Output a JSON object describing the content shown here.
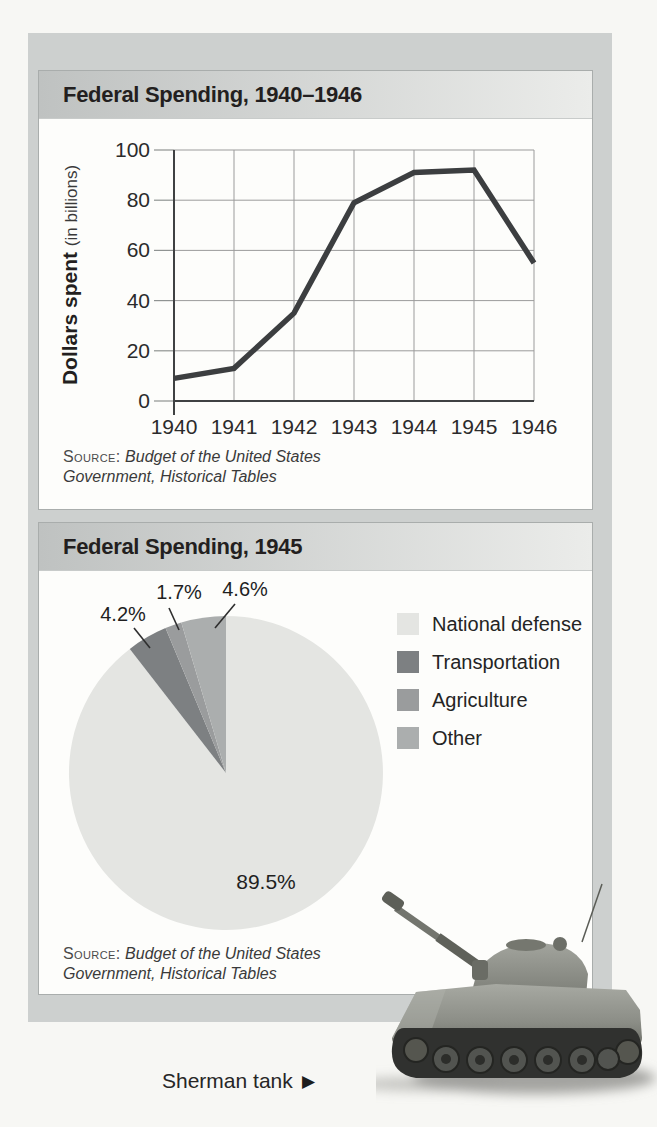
{
  "colors": {
    "page_background": "#f7f7f4",
    "panel_background": "#cdd0cf",
    "card_background": "#fdfdfb",
    "card_border": "#a9adac",
    "titlebar_gradient_left": "#bfc2c1",
    "titlebar_gradient_right": "#ebecea",
    "grid_line": "#9b9b9b",
    "axis_line": "#3f4142",
    "data_line": "#3c3e40"
  },
  "line_card": {
    "title": "Federal Spending, 1940–1946",
    "y_axis_label_bold": "Dollars spent",
    "y_axis_label_paren": "(in billions)",
    "source_label": "Source:",
    "source_work": "Budget of the United States Government, Historical Tables"
  },
  "pie_card": {
    "title": "Federal Spending, 1945",
    "source_label": "Source:",
    "source_work": "Budget of the United States Government, Historical Tables"
  },
  "caption": {
    "text": "Sherman tank",
    "arrow": "▶"
  },
  "chart_data": [
    {
      "type": "line",
      "title": "Federal Spending, 1940–1946",
      "x": [
        1940,
        1941,
        1942,
        1943,
        1944,
        1945,
        1946
      ],
      "values": [
        9,
        13,
        35,
        79,
        91,
        92,
        55
      ],
      "xlabel": "",
      "ylabel": "Dollars spent (in billions)",
      "ylim": [
        0,
        100
      ],
      "yticks": [
        0,
        20,
        40,
        60,
        80,
        100
      ],
      "grid": true,
      "line_color": "#3c3e40",
      "source": "Budget of the United States Government, Historical Tables"
    },
    {
      "type": "pie",
      "title": "Federal Spending, 1945",
      "labels": [
        "National defense",
        "Transportation",
        "Agriculture",
        "Other"
      ],
      "values": [
        89.5,
        4.2,
        1.7,
        4.6
      ],
      "percent_labels": [
        "89.5%",
        "4.2%",
        "1.7%",
        "4.6%"
      ],
      "colors": [
        "#e4e5e2",
        "#7d8082",
        "#9a9c9d",
        "#abaeae"
      ],
      "start_angle": "12 o'clock, clockwise",
      "legend_position": "right",
      "source": "Budget of the United States Government, Historical Tables"
    }
  ]
}
